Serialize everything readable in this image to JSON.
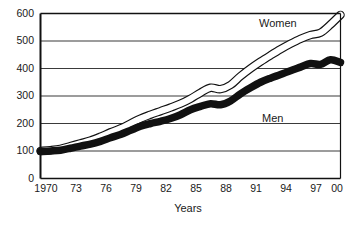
{
  "chart_data": {
    "type": "line",
    "title": "",
    "subtitle": "",
    "xlabel": "Years",
    "ylabel": "",
    "xlim": [
      1970,
      2000
    ],
    "ylim": [
      0,
      600
    ],
    "grid": true,
    "legend_position": "inline-annotation",
    "x": [
      1970,
      1971,
      1972,
      1973,
      1974,
      1975,
      1976,
      1977,
      1978,
      1979,
      1980,
      1981,
      1982,
      1983,
      1984,
      1985,
      1986,
      1987,
      1988,
      1989,
      1990,
      1991,
      1992,
      1993,
      1994,
      1995,
      1996,
      1997,
      1998,
      1999,
      2000
    ],
    "xticks": [
      "1970",
      "73",
      "76",
      "79",
      "82",
      "85",
      "88",
      "91",
      "94",
      "97",
      "00"
    ],
    "xtick_values": [
      1970,
      1973,
      1976,
      1979,
      1982,
      1985,
      1988,
      1991,
      1994,
      1997,
      2000
    ],
    "yticks": [
      "0",
      "100",
      "200",
      "300",
      "400",
      "500",
      "600"
    ],
    "ytick_values": [
      0,
      100,
      200,
      300,
      400,
      500,
      600
    ],
    "series": [
      {
        "name": "Women",
        "style": "outlined-band",
        "color": "#ffffff",
        "stroke": "#111111",
        "values": [
          100,
          103,
          108,
          118,
          128,
          138,
          152,
          168,
          182,
          200,
          218,
          232,
          245,
          258,
          272,
          290,
          312,
          330,
          325,
          340,
          372,
          400,
          425,
          448,
          470,
          490,
          508,
          522,
          530,
          560,
          595
        ]
      },
      {
        "name": "Men",
        "style": "filled-band",
        "color": "#111111",
        "stroke": "#111111",
        "values": [
          98,
          100,
          103,
          110,
          118,
          125,
          135,
          148,
          160,
          175,
          190,
          200,
          208,
          218,
          232,
          250,
          262,
          272,
          268,
          282,
          308,
          330,
          350,
          365,
          378,
          392,
          405,
          418,
          415,
          432,
          422
        ]
      }
    ],
    "annotations": [
      {
        "text": "Women",
        "x": 1994,
        "y": 565
      },
      {
        "text": "Men",
        "x": 1992,
        "y": 215
      }
    ]
  },
  "axis": {
    "x_title": "Years"
  },
  "colors": {
    "axis": "#111111",
    "grid": "#3a3a3a",
    "women_fill": "#ffffff",
    "men_fill": "#111111",
    "background": "#ffffff"
  }
}
